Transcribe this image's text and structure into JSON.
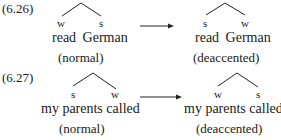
{
  "examples": [
    {
      "number": "(6.26)",
      "left": {
        "nodes": [
          "w",
          "s"
        ],
        "phrase": "read  German",
        "label": "(normal)"
      },
      "right": {
        "nodes": [
          "s",
          "w"
        ],
        "phrase": "read  German",
        "label": "(deaccented)"
      }
    },
    {
      "number": "(6.27)",
      "left": {
        "nodes": [
          "s",
          "w"
        ],
        "phrase": "my parents called",
        "label": "(normal)"
      },
      "right": {
        "nodes": [
          "w",
          "s"
        ],
        "phrase": "my parents called",
        "label": "(deaccented)"
      }
    }
  ],
  "arrow_icon": "right-arrow"
}
